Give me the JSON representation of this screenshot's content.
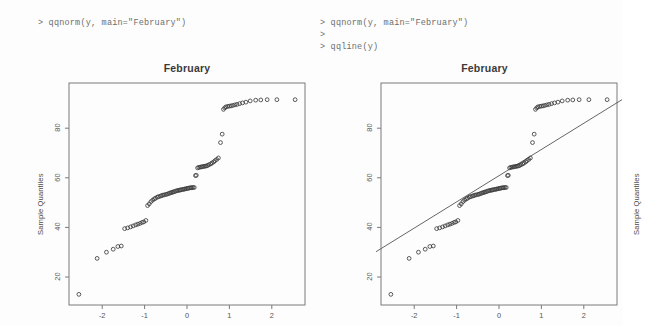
{
  "console": {
    "left_lines": "> qqnorm(y, main=\"February\")",
    "right_lines": "> qqnorm(y, main=\"February\")\n>\n> qqline(y)"
  },
  "plots": [
    {
      "title": "February",
      "ylabel": "Sample Quantiles",
      "has_qqline": false
    },
    {
      "title": "February",
      "ylabel": "Sample Quantiles",
      "has_qqline": true
    }
  ],
  "axis": {
    "x_ticks": [
      "-2",
      "-1",
      "0",
      "1",
      "2"
    ],
    "y_ticks": [
      "80",
      "60",
      "40",
      "20"
    ]
  },
  "chart_data": {
    "type": "scatter",
    "title": "February",
    "xlabel": "",
    "ylabel": "Sample Quantiles",
    "xlim": [
      -2.9,
      2.9
    ],
    "ylim": [
      10,
      95
    ],
    "grid": false,
    "legend": null,
    "x_ticks": [
      -2,
      -1,
      0,
      1,
      2
    ],
    "y_ticks": [
      20,
      40,
      60,
      80
    ],
    "annotations": [
      "Normal Q-Q plot of monthly data; right panel adds qqline fit through the first and third quartiles."
    ],
    "qqline": {
      "x0": -2.9,
      "y0": 30.2,
      "x1": 2.9,
      "y1": 91.5
    },
    "x": [
      -2.55,
      -2.12,
      -1.9,
      -1.74,
      -1.63,
      -1.55,
      -1.47,
      -1.4,
      -1.33,
      -1.27,
      -1.21,
      -1.16,
      -1.11,
      -1.06,
      -1.02,
      -0.97,
      -0.93,
      -0.89,
      -0.85,
      -0.81,
      -0.77,
      -0.74,
      -0.7,
      -0.67,
      -0.63,
      -0.6,
      -0.57,
      -0.54,
      -0.5,
      -0.47,
      -0.44,
      -0.41,
      -0.38,
      -0.35,
      -0.33,
      -0.3,
      -0.27,
      -0.24,
      -0.21,
      -0.18,
      -0.16,
      -0.13,
      -0.1,
      -0.07,
      -0.05,
      -0.02,
      0.01,
      0.03,
      0.06,
      0.09,
      0.11,
      0.14,
      0.17,
      0.2,
      0.22,
      0.25,
      0.28,
      0.31,
      0.34,
      0.37,
      0.4,
      0.43,
      0.46,
      0.49,
      0.52,
      0.56,
      0.59,
      0.63,
      0.66,
      0.7,
      0.74,
      0.79,
      0.83,
      0.86,
      0.89,
      0.92,
      0.96,
      1.0,
      1.04,
      1.08,
      1.13,
      1.18,
      1.24,
      1.31,
      1.39,
      1.49,
      1.62,
      1.74,
      1.89,
      2.12,
      2.55
    ],
    "y": [
      13.0,
      27.5,
      30.0,
      31.2,
      32.3,
      32.5,
      39.5,
      39.8,
      40.2,
      40.6,
      41.0,
      41.3,
      41.6,
      42.0,
      42.2,
      42.8,
      48.8,
      49.5,
      50.4,
      51.0,
      51.5,
      51.8,
      52.2,
      52.4,
      52.6,
      52.8,
      53.0,
      53.1,
      53.3,
      53.4,
      53.6,
      53.8,
      54.0,
      54.1,
      54.3,
      54.4,
      54.6,
      54.8,
      54.9,
      55.0,
      55.1,
      55.2,
      55.3,
      55.4,
      55.5,
      55.6,
      55.7,
      55.8,
      55.9,
      56.0,
      56.0,
      56.1,
      56.1,
      60.9,
      61.0,
      64.0,
      64.2,
      64.3,
      64.4,
      64.5,
      64.6,
      64.7,
      64.8,
      65.0,
      65.3,
      65.6,
      66.0,
      66.4,
      66.9,
      67.4,
      68.0,
      74.2,
      77.6,
      87.6,
      88.2,
      88.6,
      88.8,
      88.9,
      89.0,
      89.2,
      89.4,
      89.6,
      89.9,
      90.2,
      90.5,
      91.0,
      91.3,
      91.4,
      91.5,
      91.5,
      91.5
    ]
  }
}
